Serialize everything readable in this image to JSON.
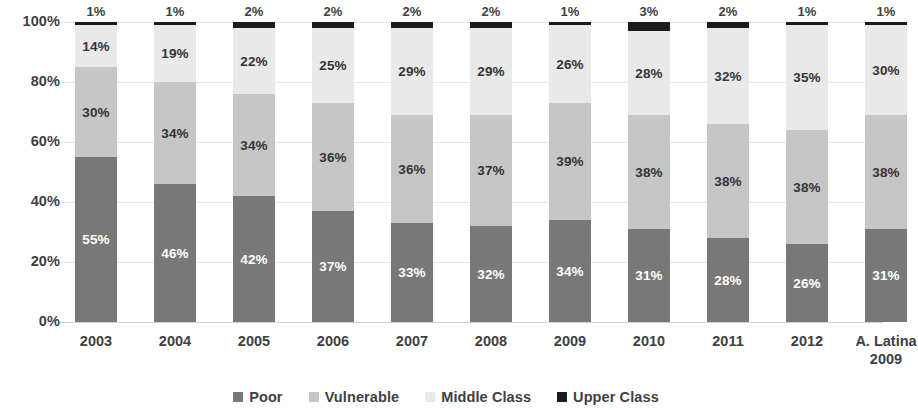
{
  "chart_data": {
    "type": "bar",
    "subtype": "stacked-100-percent",
    "title": "",
    "xlabel": "",
    "ylabel": "",
    "ylim": [
      0,
      100
    ],
    "yticks": [
      "0%",
      "20%",
      "40%",
      "60%",
      "80%",
      "100%"
    ],
    "ytick_values": [
      0,
      20,
      40,
      60,
      80,
      100
    ],
    "grid": true,
    "legend_position": "bottom",
    "categories": [
      "2003",
      "2004",
      "2005",
      "2006",
      "2007",
      "2008",
      "2009",
      "2010",
      "2011",
      "2012",
      "A. Latina 2009"
    ],
    "category_lines": [
      [
        "2003"
      ],
      [
        "2004"
      ],
      [
        "2005"
      ],
      [
        "2006"
      ],
      [
        "2007"
      ],
      [
        "2008"
      ],
      [
        "2009"
      ],
      [
        "2010"
      ],
      [
        "2011"
      ],
      [
        "2012"
      ],
      [
        "A. Latina",
        "2009"
      ]
    ],
    "series": [
      {
        "name": "Poor",
        "color": "#787878",
        "values": [
          55,
          46,
          42,
          37,
          33,
          32,
          34,
          31,
          28,
          26,
          31
        ],
        "labels": [
          "55%",
          "46%",
          "42%",
          "37%",
          "33%",
          "32%",
          "34%",
          "31%",
          "28%",
          "26%",
          "31%"
        ]
      },
      {
        "name": "Vulnerable",
        "color": "#c6c6c6",
        "values": [
          30,
          34,
          34,
          36,
          36,
          37,
          39,
          38,
          38,
          38,
          38
        ],
        "labels": [
          "30%",
          "34%",
          "34%",
          "36%",
          "36%",
          "37%",
          "39%",
          "38%",
          "38%",
          "38%",
          "38%"
        ]
      },
      {
        "name": "Middle Class",
        "color": "#e9e9e9",
        "values": [
          14,
          19,
          22,
          25,
          29,
          29,
          26,
          28,
          32,
          35,
          30
        ],
        "labels": [
          "14%",
          "19%",
          "22%",
          "25%",
          "29%",
          "29%",
          "26%",
          "28%",
          "32%",
          "35%",
          "30%"
        ]
      },
      {
        "name": "Upper Class",
        "color": "#1b1b1b",
        "values": [
          1,
          1,
          2,
          2,
          2,
          2,
          1,
          3,
          2,
          1,
          1
        ],
        "labels": [
          "1%",
          "1%",
          "2%",
          "2%",
          "2%",
          "2%",
          "1%",
          "3%",
          "2%",
          "1%",
          "1%"
        ],
        "labels_outside": true
      }
    ]
  },
  "legend": {
    "items": [
      {
        "label": "Poor",
        "color": "#787878"
      },
      {
        "label": "Vulnerable",
        "color": "#c6c6c6"
      },
      {
        "label": "Middle Class",
        "color": "#e9e9e9"
      },
      {
        "label": "Upper Class",
        "color": "#1b1b1b"
      }
    ]
  }
}
